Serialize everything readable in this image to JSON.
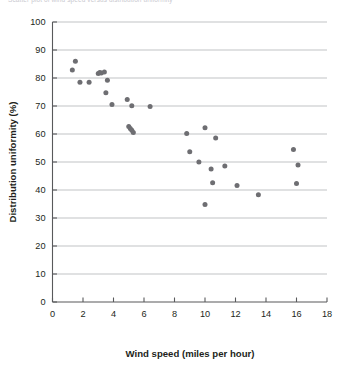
{
  "figure": {
    "title": "Scatter plot of wind speed versus distribution uniformity",
    "background_color": "#ffffff",
    "marker_color": "#6e6e72",
    "gridline_color": "#a7a9ac",
    "axis_color": "#58595b",
    "text_color": "#231f20"
  },
  "chart_data": {
    "type": "scatter",
    "title": "",
    "xlabel": "Wind speed (miles per hour)",
    "ylabel": "Distribution uniformity (%)",
    "xlim": [
      0,
      18
    ],
    "ylim": [
      0,
      100
    ],
    "xticks": [
      0,
      2,
      4,
      6,
      8,
      10,
      12,
      14,
      16,
      18
    ],
    "yticks": [
      0,
      10,
      20,
      30,
      40,
      50,
      60,
      70,
      80,
      90,
      100
    ],
    "grid": "horizontal",
    "legend": "none",
    "series": [
      {
        "name": "Observations",
        "marker": "circle",
        "color": "#6e6e72",
        "points": [
          {
            "x": 1.5,
            "y": 86.0
          },
          {
            "x": 1.3,
            "y": 82.9
          },
          {
            "x": 1.8,
            "y": 78.5
          },
          {
            "x": 2.4,
            "y": 78.5
          },
          {
            "x": 3.0,
            "y": 81.6
          },
          {
            "x": 3.1,
            "y": 82.0
          },
          {
            "x": 3.2,
            "y": 81.8
          },
          {
            "x": 3.4,
            "y": 82.1
          },
          {
            "x": 3.6,
            "y": 79.2
          },
          {
            "x": 3.5,
            "y": 74.7
          },
          {
            "x": 3.9,
            "y": 70.5
          },
          {
            "x": 4.9,
            "y": 72.3
          },
          {
            "x": 5.2,
            "y": 70.1
          },
          {
            "x": 6.4,
            "y": 69.8
          },
          {
            "x": 5.0,
            "y": 62.7
          },
          {
            "x": 5.1,
            "y": 62.0
          },
          {
            "x": 5.2,
            "y": 61.3
          },
          {
            "x": 5.3,
            "y": 60.5
          },
          {
            "x": 8.8,
            "y": 60.2
          },
          {
            "x": 10.0,
            "y": 62.2
          },
          {
            "x": 9.0,
            "y": 53.7
          },
          {
            "x": 10.7,
            "y": 58.6
          },
          {
            "x": 9.6,
            "y": 50.0
          },
          {
            "x": 10.4,
            "y": 47.5
          },
          {
            "x": 11.3,
            "y": 48.6
          },
          {
            "x": 15.8,
            "y": 54.5
          },
          {
            "x": 10.5,
            "y": 42.6
          },
          {
            "x": 12.1,
            "y": 41.6
          },
          {
            "x": 13.5,
            "y": 38.3
          },
          {
            "x": 16.1,
            "y": 48.9
          },
          {
            "x": 16.0,
            "y": 42.3
          },
          {
            "x": 10.0,
            "y": 34.8
          }
        ]
      }
    ]
  },
  "axes": {
    "x_tick_labels": [
      "0",
      "2",
      "4",
      "6",
      "8",
      "10",
      "12",
      "14",
      "16",
      "18"
    ],
    "y_tick_labels": [
      "0",
      "10",
      "20",
      "30",
      "40",
      "50",
      "60",
      "70",
      "80",
      "90",
      "100"
    ]
  }
}
